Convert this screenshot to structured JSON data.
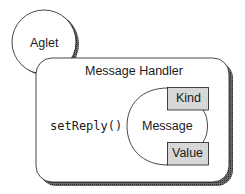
{
  "diagram": {
    "aglet": {
      "label": "Aglet"
    },
    "handler": {
      "title": "Message Handler",
      "method": "setReply()"
    },
    "message": {
      "label": "Message",
      "fields": [
        {
          "label": "Kind"
        },
        {
          "label": "Value"
        }
      ]
    },
    "colors": {
      "stroke": "#1a1a1a",
      "shadow": "#555555",
      "field_fill": "#d9d9d9",
      "background": "#ffffff"
    }
  }
}
